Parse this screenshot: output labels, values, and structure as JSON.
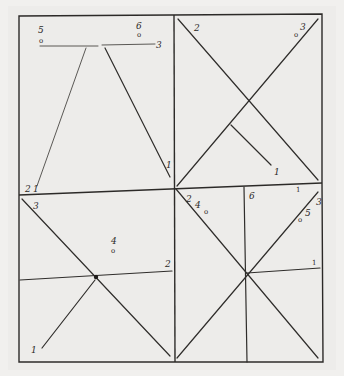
{
  "diagram": {
    "panels": [
      {
        "id": "top-left",
        "labels": [
          {
            "text": "5",
            "x": 42,
            "y": 32
          },
          {
            "text": "o",
            "x": 42,
            "y": 42
          },
          {
            "text": "6",
            "x": 140,
            "y": 28
          },
          {
            "text": "o",
            "x": 140,
            "y": 36
          },
          {
            "text": "3",
            "x": 158,
            "y": 46
          },
          {
            "text": "1",
            "x": 168,
            "y": 167
          },
          {
            "text": "2",
            "x": 28,
            "y": 190
          },
          {
            "text": "1",
            "x": 36,
            "y": 190
          }
        ]
      },
      {
        "id": "top-right",
        "labels": [
          {
            "text": "2",
            "x": 196,
            "y": 31
          },
          {
            "text": "3",
            "x": 303,
            "y": 29
          },
          {
            "text": "o",
            "x": 297,
            "y": 37
          },
          {
            "text": "1",
            "x": 276,
            "y": 174
          }
        ]
      },
      {
        "id": "bottom-left",
        "labels": [
          {
            "text": "3",
            "x": 35,
            "y": 209
          },
          {
            "text": "4",
            "x": 113,
            "y": 244
          },
          {
            "text": "o",
            "x": 113,
            "y": 253
          },
          {
            "text": "2",
            "x": 167,
            "y": 266
          },
          {
            "text": "1",
            "x": 33,
            "y": 353
          }
        ]
      },
      {
        "id": "bottom-right",
        "labels": [
          {
            "text": "2",
            "x": 188,
            "y": 199
          },
          {
            "text": "4",
            "x": 197,
            "y": 207
          },
          {
            "text": "o",
            "x": 205,
            "y": 213
          },
          {
            "text": "6",
            "x": 251,
            "y": 198
          },
          {
            "text": "1",
            "x": 297,
            "y": 192
          },
          {
            "text": "3",
            "x": 318,
            "y": 205
          },
          {
            "text": "5",
            "x": 308,
            "y": 215
          },
          {
            "text": "o",
            "x": 300,
            "y": 222
          },
          {
            "text": "1",
            "x": 314,
            "y": 265
          }
        ]
      }
    ]
  }
}
